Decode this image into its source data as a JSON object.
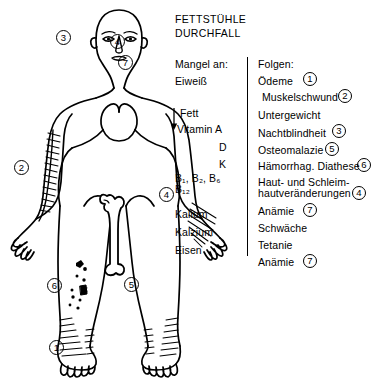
{
  "document": {
    "title_lines": [
      "FETTSTÜHLE",
      "DURCHFALL"
    ],
    "language": "de"
  },
  "columns": {
    "left": {
      "header": "Mangel an:",
      "items": [
        {
          "label": "Eiweiß"
        },
        {
          "label": "Fett"
        },
        {
          "label": "Vitamin A"
        },
        {
          "label": "D"
        },
        {
          "label": "K"
        },
        {
          "label": "B₁, B₂, B₆"
        },
        {
          "label": "B₁₂"
        },
        {
          "label": "Kalium"
        },
        {
          "label": "Kalzium"
        },
        {
          "label": "Eisen"
        }
      ],
      "arrow_icon": "down-arrow-icon"
    },
    "right": {
      "header": "Folgen:",
      "items": [
        {
          "label": "Ödeme",
          "marker": "1"
        },
        {
          "label": "Muskelschwund",
          "marker": "2"
        },
        {
          "label": "Untergewicht",
          "marker": ""
        },
        {
          "label": "Nachtblindheit",
          "marker": "3"
        },
        {
          "label": "Osteomalazie",
          "marker": "5"
        },
        {
          "label": "Hämorrhag. Diathese",
          "marker": "6"
        },
        {
          "label_line1": "Haut- und Schleim-",
          "label_line2": "hautveränderungen",
          "marker": "4"
        },
        {
          "label": "Anämie",
          "marker": "7"
        },
        {
          "label": "Schwäche",
          "marker": ""
        },
        {
          "label": "Tetanie",
          "marker": ""
        },
        {
          "label": "Anämie",
          "marker": "7"
        }
      ]
    }
  },
  "body_markers": [
    {
      "id": "3",
      "region": "left-eye",
      "label": "3"
    },
    {
      "id": "4",
      "region": "right-face",
      "label": "4"
    },
    {
      "id": "7",
      "region": "neck",
      "label": "7"
    },
    {
      "id": "2",
      "region": "left-arm-muscle",
      "label": "2"
    },
    {
      "id": "4b",
      "region": "right-hand",
      "label": "4"
    },
    {
      "id": "6",
      "region": "left-shin-purpura",
      "label": "6"
    },
    {
      "id": "5",
      "region": "right-shin-bone",
      "label": "5"
    },
    {
      "id": "1",
      "region": "left-ankle-edema",
      "label": "1"
    }
  ],
  "colors": {
    "ink": "#000000",
    "background": "#ffffff"
  }
}
